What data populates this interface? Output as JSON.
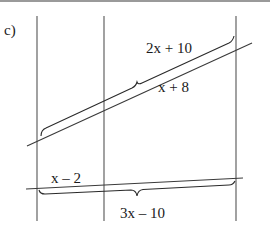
{
  "figure": {
    "part_label": "c)",
    "colors": {
      "line": "#3a3a3a",
      "vertical": "#555555",
      "text": "#1a1a1a",
      "rule": "#9a9a9a"
    }
  },
  "labels": {
    "top_brace": "2x + 10",
    "top_segment": "x + 8",
    "bottom_left": "x – 2",
    "bottom_brace": "3x – 10"
  },
  "geometry": {
    "vertical_lines_x": [
      37,
      104,
      236
    ],
    "vertical_y_range": [
      16,
      221
    ],
    "upper_transversal": [
      [
        27,
        146
      ],
      [
        252,
        43
      ]
    ],
    "lower_transversal": [
      [
        26,
        189
      ],
      [
        243,
        178
      ]
    ]
  }
}
